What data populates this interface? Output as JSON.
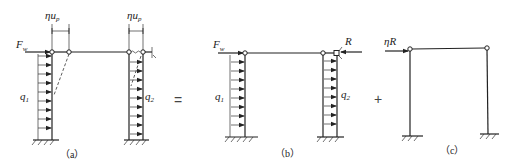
{
  "figure": {
    "panels": [
      {
        "id": "a",
        "caption": "（a）",
        "labels": {
          "force": "F",
          "force_sub": "w",
          "disp_left": "ηu",
          "disp_left_sub": "p",
          "disp_right": "ηu",
          "disp_right_sub": "p",
          "load_left": "q",
          "load_left_sub": "1",
          "load_right": "q",
          "load_right_sub": "2"
        }
      },
      {
        "id": "b",
        "caption": "（b）",
        "labels": {
          "force": "F",
          "force_sub": "w",
          "reaction": "R",
          "load_left": "q",
          "load_left_sub": "1",
          "load_right": "q",
          "load_right_sub": "2"
        }
      },
      {
        "id": "c",
        "caption": "（c）",
        "labels": {
          "force": "ηR"
        }
      }
    ],
    "operators": {
      "equals": "=",
      "plus": "+"
    }
  }
}
